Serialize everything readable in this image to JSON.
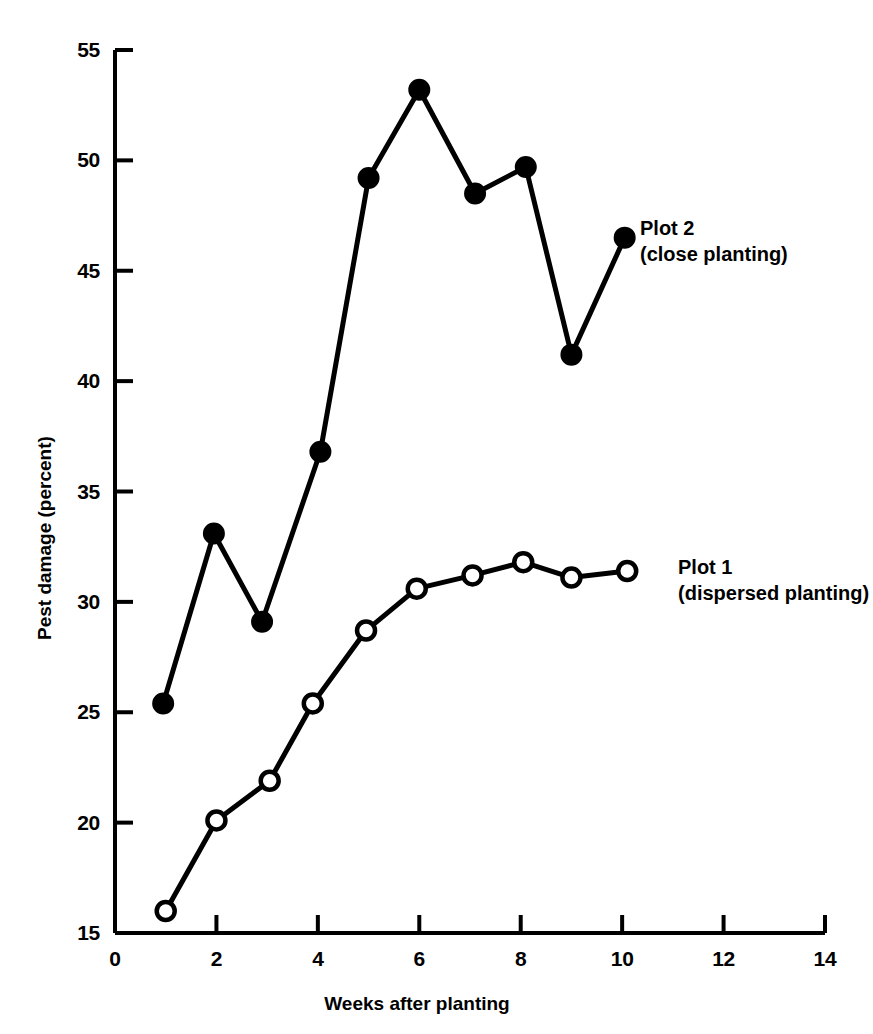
{
  "chart_data": {
    "type": "line",
    "title": "",
    "xlabel": "Weeks after planting",
    "ylabel": "Pest damage (percent)",
    "xlim": [
      0,
      14
    ],
    "ylim": [
      15,
      55
    ],
    "xticks": [
      0,
      2,
      4,
      6,
      8,
      10,
      12,
      14
    ],
    "yticks": [
      15,
      20,
      25,
      30,
      35,
      40,
      45,
      50,
      55
    ],
    "grid": false,
    "legend_position": "inline-right-of-last-point",
    "series": [
      {
        "name": "Plot 1",
        "subtitle": "(dispersed planting)",
        "marker": "open-circle",
        "color": "#000000",
        "x": [
          1.0,
          2.0,
          3.05,
          3.9,
          4.95,
          5.95,
          7.05,
          8.05,
          9.0,
          10.1
        ],
        "values": [
          16.0,
          20.1,
          21.9,
          25.4,
          28.7,
          30.6,
          31.2,
          31.8,
          31.1,
          31.4
        ]
      },
      {
        "name": "Plot 2",
        "subtitle": "(close planting)",
        "marker": "filled-circle",
        "color": "#000000",
        "x": [
          0.95,
          1.95,
          2.9,
          4.05,
          5.0,
          6.0,
          7.1,
          8.1,
          9.0,
          10.05
        ],
        "values": [
          25.4,
          33.1,
          29.1,
          36.8,
          49.2,
          53.2,
          48.5,
          49.7,
          41.2,
          46.5
        ]
      }
    ]
  },
  "annotations": {
    "plot2": {
      "label": "Plot 2",
      "sublabel": "(close planting)"
    },
    "plot1": {
      "label": "Plot 1",
      "sublabel": "(dispersed planting)"
    }
  },
  "axes": {
    "x_title": "Weeks after planting",
    "y_title": "Pest damage (percent)",
    "x_tick_labels": [
      "0",
      "2",
      "4",
      "6",
      "8",
      "10",
      "12",
      "14"
    ],
    "y_tick_labels": [
      "15",
      "20",
      "25",
      "30",
      "35",
      "40",
      "45",
      "50",
      "55"
    ]
  }
}
